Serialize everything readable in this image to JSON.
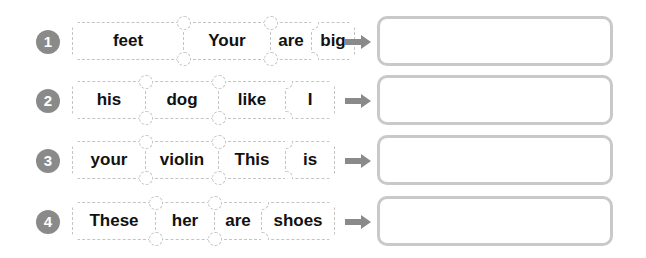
{
  "exercise": {
    "rows": [
      {
        "number": "1",
        "words": [
          "feet",
          "Your",
          "are",
          "big"
        ],
        "widths": [
          112,
          84,
          42,
          46
        ],
        "answer": ""
      },
      {
        "number": "2",
        "words": [
          "his",
          "dog",
          "like",
          "I"
        ],
        "widths": [
          74,
          74,
          66,
          50
        ],
        "answer": ""
      },
      {
        "number": "3",
        "words": [
          "your",
          "violin",
          "This",
          "is"
        ],
        "widths": [
          74,
          74,
          66,
          50
        ],
        "answer": ""
      },
      {
        "number": "4",
        "words": [
          "These",
          "her",
          "are",
          "shoes"
        ],
        "widths": [
          84,
          58,
          48,
          76
        ],
        "answer": ""
      }
    ]
  },
  "colors": {
    "badge": "#8a8a8a",
    "arrow": "#8a8a8a",
    "answer_border": "#c9c9c9",
    "card_border": "#c4c4c4"
  }
}
